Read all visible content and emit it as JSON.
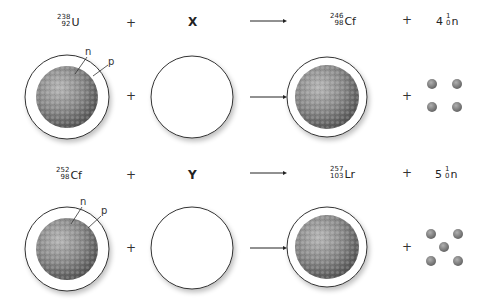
{
  "reactions": [
    {
      "reactant1": {
        "mass": "238",
        "atomic": "92",
        "symbol": "U"
      },
      "reactant2": {
        "symbol": "X"
      },
      "product": {
        "mass": "246",
        "atomic": "98",
        "symbol": "Cf"
      },
      "neutrons": {
        "coefficient": "4",
        "mass": "1",
        "atomic": "0",
        "symbol": "n",
        "count": 4
      },
      "plus": "+",
      "labels": {
        "neutron": "n",
        "proton": "p"
      }
    },
    {
      "reactant1": {
        "mass": "252",
        "atomic": "98",
        "symbol": "Cf"
      },
      "reactant2": {
        "symbol": "Y"
      },
      "product": {
        "mass": "257",
        "atomic": "103",
        "symbol": "Lr"
      },
      "neutrons": {
        "coefficient": "5",
        "mass": "1",
        "atomic": "0",
        "symbol": "n",
        "count": 5
      },
      "plus": "+",
      "labels": {
        "neutron": "n",
        "proton": "p"
      }
    }
  ],
  "colors": {
    "nucleus": "#7a7a7a",
    "nucleus_highlight": "#a8a8a8",
    "neutron": "#7f7f7f",
    "outline": "#333333",
    "arrow": "#222222"
  }
}
